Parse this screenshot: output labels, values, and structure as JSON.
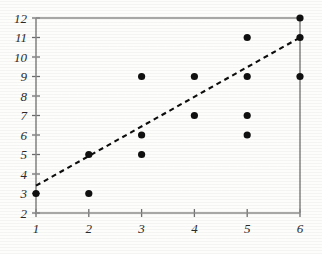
{
  "chart_data": {
    "type": "scatter",
    "title": "",
    "xlabel": "",
    "ylabel": "",
    "xlim": [
      1,
      6
    ],
    "ylim": [
      2,
      12
    ],
    "grid": false,
    "legend": "none",
    "x_ticks": [
      "1",
      "2",
      "3",
      "4",
      "5",
      "6"
    ],
    "y_ticks": [
      "2",
      "3",
      "4",
      "5",
      "6",
      "7",
      "8",
      "9",
      "10",
      "11",
      "12"
    ],
    "points": [
      {
        "x": 1,
        "y": 3
      },
      {
        "x": 2,
        "y": 3
      },
      {
        "x": 2,
        "y": 5
      },
      {
        "x": 3,
        "y": 5
      },
      {
        "x": 3,
        "y": 6
      },
      {
        "x": 3,
        "y": 9
      },
      {
        "x": 4,
        "y": 7
      },
      {
        "x": 4,
        "y": 9
      },
      {
        "x": 5,
        "y": 6
      },
      {
        "x": 5,
        "y": 7
      },
      {
        "x": 5,
        "y": 9
      },
      {
        "x": 5,
        "y": 11
      },
      {
        "x": 6,
        "y": 9
      },
      {
        "x": 6,
        "y": 11
      },
      {
        "x": 6,
        "y": 12
      }
    ],
    "series": [
      {
        "name": "observations",
        "marker": "filled-circle",
        "color": "#101010",
        "x": [
          1,
          2,
          2,
          3,
          3,
          3,
          4,
          4,
          5,
          5,
          5,
          5,
          6,
          6,
          6
        ],
        "values": [
          3,
          3,
          5,
          5,
          6,
          9,
          7,
          9,
          6,
          7,
          9,
          11,
          9,
          11,
          12
        ]
      },
      {
        "name": "trend-line",
        "type": "line",
        "style": "dashed",
        "color": "#0d0d0d",
        "x": [
          1,
          6
        ],
        "values": [
          3.4,
          11.0
        ]
      }
    ],
    "annotations": []
  },
  "colors": {
    "background": "#fdfdfb",
    "axis": "#8a8a8a",
    "tick": "#6f6f6f",
    "point": "#101010",
    "trend": "#0d0d0d",
    "label": "#2a2a2a"
  }
}
